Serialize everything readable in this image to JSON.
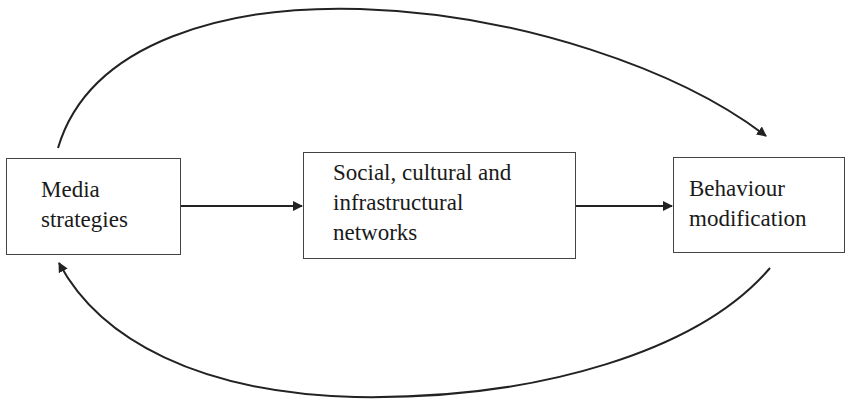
{
  "diagram": {
    "nodes": [
      {
        "id": "media",
        "lines": [
          "Media",
          "strategies"
        ]
      },
      {
        "id": "networks",
        "lines": [
          "Social, cultural and",
          "infrastructural",
          "networks"
        ]
      },
      {
        "id": "behaviour",
        "lines": [
          "Behaviour",
          "modification"
        ]
      }
    ],
    "edges": [
      {
        "from": "media",
        "to": "networks",
        "style": "straight"
      },
      {
        "from": "networks",
        "to": "behaviour",
        "style": "straight"
      },
      {
        "from": "media",
        "to": "behaviour",
        "style": "curved-top"
      },
      {
        "from": "behaviour",
        "to": "media",
        "style": "curved-bottom"
      }
    ],
    "colors": {
      "stroke": "#222222",
      "box_border": "#444444",
      "background": "#ffffff"
    }
  }
}
